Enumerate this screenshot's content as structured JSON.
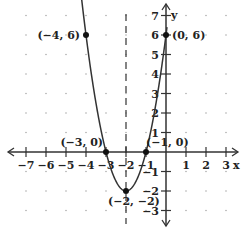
{
  "chart_data": {
    "type": "line",
    "title": "",
    "xlabel": "x",
    "ylabel": "y",
    "xlim": [
      -7,
      3
    ],
    "ylim": [
      -3,
      7
    ],
    "grid": "dots",
    "x_ticks": [
      "-7",
      "-6",
      "-5",
      "-4",
      "-3",
      "-2",
      "-1",
      "1",
      "2",
      "3"
    ],
    "y_ticks": [
      "7",
      "6",
      "5",
      "4",
      "3",
      "2",
      "1",
      "-1",
      "-2",
      "-3"
    ],
    "function": "y = 2(x + 2)^2 - 2",
    "axis_of_symmetry": {
      "x": -2,
      "style": "dashed"
    },
    "series": [
      {
        "name": "parabola",
        "x": [
          -4.24,
          -4,
          -3,
          -2,
          -1,
          0,
          0.06
        ],
        "y": [
          7,
          6,
          0,
          -2,
          0,
          6,
          7
        ]
      }
    ],
    "points": [
      {
        "label": "(−4, 6)",
        "x": -4,
        "y": 6
      },
      {
        "label": "(0, 6)",
        "x": 0,
        "y": 6
      },
      {
        "label": "(−3, 0)",
        "x": -3,
        "y": 0
      },
      {
        "label": "(−1, 0)",
        "x": -1,
        "y": 0
      },
      {
        "label": "(−2, −2)",
        "x": -2,
        "y": -2
      }
    ]
  }
}
